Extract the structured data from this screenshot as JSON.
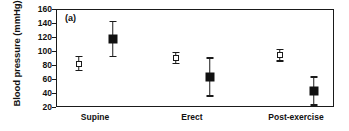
{
  "chart_data": {
    "type": "scatter",
    "title": "",
    "panel_label": "(a)",
    "xlabel": "",
    "ylabel": "Blood pressure (mmHg)",
    "categories": [
      "Supine",
      "Erect",
      "Post-exercise"
    ],
    "ylim": [
      20,
      160
    ],
    "yticks": [
      160,
      140,
      120,
      100,
      80,
      60,
      40,
      20
    ],
    "ytick_labels": [
      "160",
      "140",
      "120",
      "100",
      "80",
      "60",
      "40",
      "20"
    ],
    "grid": false,
    "legend": "none",
    "series": [
      {
        "name": "open-square",
        "marker": "open square",
        "color": "#ffffff",
        "edge_color": "#1a1a1a",
        "values": [
          82,
          90,
          94
        ],
        "err_low": [
          10,
          8,
          8
        ],
        "err_high": [
          10,
          8,
          8
        ]
      },
      {
        "name": "filled-square",
        "marker": "filled square",
        "color": "#101010",
        "edge_color": "#101010",
        "values": [
          117,
          63,
          43
        ],
        "err_low": [
          25,
          27,
          20
        ],
        "err_high": [
          25,
          27,
          20
        ]
      }
    ]
  },
  "axis": {
    "y_title": "Blood pressure (mmHg)",
    "panel_tag": "(a)"
  }
}
